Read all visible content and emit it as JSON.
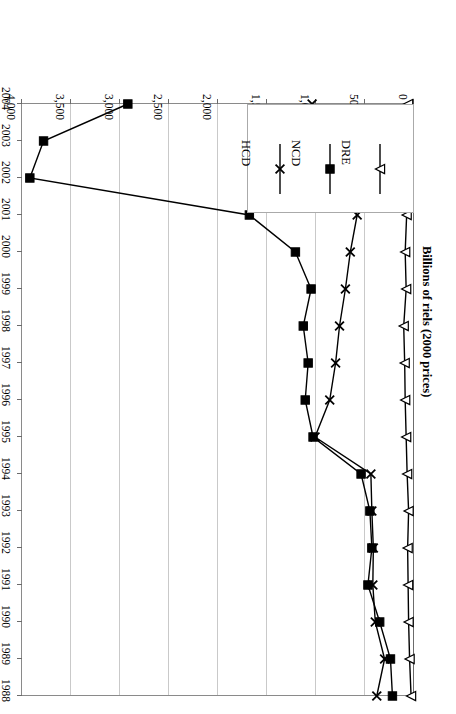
{
  "chart": {
    "type": "line",
    "ylabel": "Billions of riels (2000 prices)",
    "xlabel": "",
    "title": "",
    "orientation": "rotated-180"
  },
  "axis": {
    "value_ticks": [
      "0",
      "500",
      "1,000",
      "1,500",
      "2,000",
      "2,500",
      "3,000",
      "3,500",
      "4,000"
    ],
    "value_tick_values": [
      0,
      500,
      1000,
      1500,
      2000,
      2500,
      3000,
      3500,
      4000
    ],
    "year_ticks": [
      "1988",
      "1989",
      "1990",
      "1991",
      "1992",
      "1993",
      "1994",
      "1995",
      "1996",
      "1997",
      "1998",
      "1999",
      "2000",
      "2001",
      "2002",
      "2003",
      "2004"
    ]
  },
  "legend": {
    "position": "inside-lower-left",
    "entries": [
      {
        "label": "HCD",
        "marker": "cross-x"
      },
      {
        "label": "NCD",
        "marker": "filled-square"
      },
      {
        "label": "DRE",
        "marker": "open-triangle"
      }
    ]
  },
  "chart_data": {
    "type": "line",
    "title": "",
    "xlabel": "",
    "ylabel": "Billions of riels (2000 prices)",
    "ylim": [
      0,
      4000
    ],
    "grid": true,
    "legend_position": "inside-lower-left",
    "categories": [
      1988,
      1989,
      1990,
      1991,
      1992,
      1993,
      1994,
      1995,
      1996,
      1997,
      1998,
      1999,
      2000,
      2001,
      2002,
      2003,
      2004
    ],
    "series": [
      {
        "name": "HCD",
        "marker": "cross-x",
        "values": [
          380,
          300,
          395,
          420,
          415,
          430,
          440,
          1010,
          860,
          800,
          760,
          700,
          650,
          580,
          760,
          960,
          1040
        ]
      },
      {
        "name": "NCD",
        "marker": "filled-square",
        "values": [
          220,
          240,
          350,
          470,
          430,
          450,
          540,
          1030,
          1110,
          1080,
          1130,
          1050,
          1210,
          1680,
          3920,
          3780,
          2920
        ]
      },
      {
        "name": "DRE",
        "marker": "open-triangle",
        "values": [
          30,
          45,
          55,
          60,
          65,
          55,
          70,
          80,
          90,
          95,
          105,
          80,
          90,
          75,
          70,
          65,
          60
        ]
      }
    ]
  }
}
